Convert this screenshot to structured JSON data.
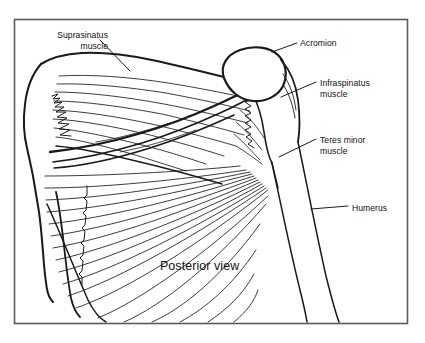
{
  "figure": {
    "kind": "anatomical-line-drawing",
    "caption": "Posterior view",
    "frame": {
      "stroke_color": "#555555",
      "fill_color": "#ffffff"
    },
    "line_color": "#1a1a1a",
    "background_color": "#ffffff"
  },
  "labels": {
    "supraspinatus": "Suprasinatus\nmuscle",
    "acromion": "Acromion",
    "infraspinatus": "Infraspinatus\nmuscle",
    "teres_minor": "Teres minor\nmuscle",
    "humerus": "Humerus",
    "posterior_view": "Posterior view"
  },
  "structures": [
    {
      "name": "supraspinatus-muscle",
      "label": "Suprasinatus muscle"
    },
    {
      "name": "acromion",
      "label": "Acromion"
    },
    {
      "name": "infraspinatus-muscle",
      "label": "Infraspinatus muscle"
    },
    {
      "name": "teres-minor-muscle",
      "label": "Teres minor muscle"
    },
    {
      "name": "humerus-bone",
      "label": "Humerus"
    },
    {
      "name": "scapula-medial-border",
      "label": "Scapula medial border"
    },
    {
      "name": "scapular-spine",
      "label": "Scapular spine"
    }
  ]
}
